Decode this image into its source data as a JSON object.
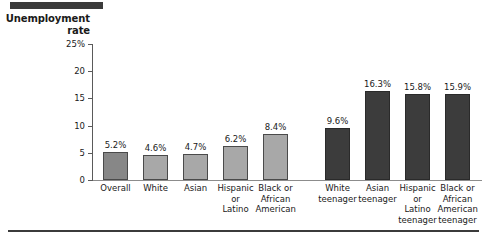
{
  "chart_data": {
    "type": "bar",
    "title": "",
    "ylabel": "Unemployment rate",
    "xlabel": "",
    "ylim": [
      0,
      25
    ],
    "grid": false,
    "legend": "none",
    "ytick_labels": [
      "25%",
      "20",
      "15",
      "10",
      "5",
      "0"
    ],
    "ytick_values": [
      25,
      20,
      15,
      10,
      5,
      0
    ],
    "categories": [
      "Overall",
      "White",
      "Asian",
      "Hispanic or Latino",
      "Black or African American",
      "White teenager",
      "Asian teenager",
      "Hispanic or Latino teenager",
      "Black or African American teenager"
    ],
    "values": [
      5.2,
      4.6,
      4.7,
      6.2,
      8.4,
      9.6,
      16.3,
      15.8,
      15.9
    ],
    "data_labels": [
      "5.2%",
      "4.6%",
      "4.7%",
      "6.2%",
      "8.4%",
      "9.6%",
      "16.3%",
      "15.8%",
      "15.9%"
    ],
    "bars": [
      {
        "label_lines": "Overall",
        "value": 5.2,
        "data_label": "5.2%",
        "shade": "medium"
      },
      {
        "label_lines": "White",
        "value": 4.6,
        "data_label": "4.6%",
        "shade": "light"
      },
      {
        "label_lines": "Asian",
        "value": 4.7,
        "data_label": "4.7%",
        "shade": "light"
      },
      {
        "label_lines": "Hispanic\nor\nLatino",
        "value": 6.2,
        "data_label": "6.2%",
        "shade": "light"
      },
      {
        "label_lines": "Black or\nAfrican\nAmerican",
        "value": 8.4,
        "data_label": "8.4%",
        "shade": "light"
      },
      {
        "label_lines": "White\nteenager",
        "value": 9.6,
        "data_label": "9.6%",
        "shade": "dark"
      },
      {
        "label_lines": "Asian\nteenager",
        "value": 16.3,
        "data_label": "16.3%",
        "shade": "dark"
      },
      {
        "label_lines": "Hispanic\nor\nLatino\nteenager",
        "value": 15.8,
        "data_label": "15.8%",
        "shade": "dark"
      },
      {
        "label_lines": "Black or\nAfrican\nAmerican\nteenager",
        "value": 15.9,
        "data_label": "15.9%",
        "shade": "dark"
      }
    ]
  },
  "colors": {
    "bar_light": "#a8a8a8",
    "bar_medium": "#878787",
    "bar_dark": "#3c3c3c",
    "rule": "#3b3b3b",
    "axis": "#5a5a5a",
    "text": "#1a1a1a",
    "background": "#ffffff"
  }
}
